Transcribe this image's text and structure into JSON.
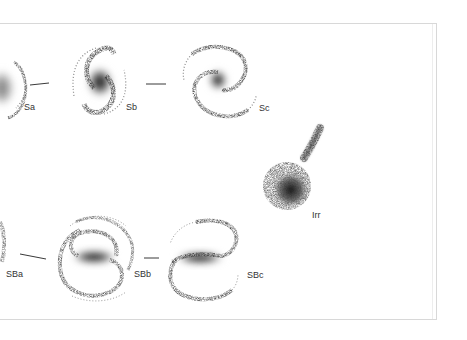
{
  "diagram": {
    "type": "hubble-tuning-fork",
    "colors": {
      "background": "#ffffff",
      "frame": "#d8d8d8",
      "ink": "#222222",
      "label": "#333333"
    },
    "spiral_row": [
      {
        "id": "sa",
        "label": "Sa"
      },
      {
        "id": "sb",
        "label": "Sb"
      },
      {
        "id": "sc",
        "label": "Sc"
      }
    ],
    "barred_row": [
      {
        "id": "sba",
        "label": "SBa"
      },
      {
        "id": "sbb",
        "label": "SBb"
      },
      {
        "id": "sbc",
        "label": "SBc"
      }
    ],
    "irregular": {
      "id": "irr",
      "label": "Irr"
    }
  }
}
